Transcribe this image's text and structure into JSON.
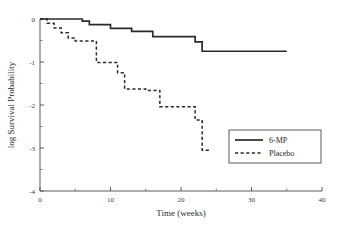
{
  "chart_data": {
    "type": "line",
    "title": "",
    "subtitle": "",
    "xlabel": "Time (weeks)",
    "ylabel": "log Survival Probability",
    "xlim": [
      0,
      40
    ],
    "ylim": [
      -4,
      0
    ],
    "xticks": [
      0,
      10,
      20,
      30,
      40
    ],
    "xticklabels": [
      "0",
      "10",
      "20",
      "30",
      "40"
    ],
    "xminorticks": [
      5,
      15,
      25,
      35
    ],
    "yticks": [
      0,
      -1,
      -2,
      -3,
      -4
    ],
    "yticklabels": [
      "0",
      "-1",
      "-2",
      "-3",
      "-4"
    ],
    "yminorticks": [
      -0.5,
      -1.5,
      -2.5,
      -3.5
    ],
    "grid": false,
    "legend_position": "center-right",
    "step_type": "post",
    "series": [
      {
        "name": "6-MP",
        "style": "solid",
        "color": "#2b2b2b",
        "x": [
          0,
          6,
          7,
          10,
          13,
          16,
          22,
          23,
          35
        ],
        "y": [
          0,
          0,
          -0.05,
          -0.13,
          -0.22,
          -0.29,
          -0.41,
          -0.75,
          -0.75
        ]
      },
      {
        "name": "Placebo",
        "style": "dashed",
        "color": "#2b2b2b",
        "x": [
          0,
          1,
          2,
          3,
          4,
          5,
          8,
          8,
          11,
          12,
          15,
          17,
          22,
          23
        ],
        "y": [
          0,
          -0.09,
          -0.19,
          -0.29,
          -0.4,
          -0.51,
          -0.51,
          -1.01,
          -1.25,
          -1.63,
          -1.63,
          -2.04,
          -2.35,
          -3.05
        ]
      }
    ],
    "series_points": {
      "6-MP": [
        {
          "x": 0,
          "y": 0
        },
        {
          "x": 6,
          "y": 0
        },
        {
          "x": 6,
          "y": -0.05
        },
        {
          "x": 7,
          "y": -0.05
        },
        {
          "x": 7,
          "y": -0.13
        },
        {
          "x": 10,
          "y": -0.13
        },
        {
          "x": 10,
          "y": -0.22
        },
        {
          "x": 13,
          "y": -0.22
        },
        {
          "x": 13,
          "y": -0.29
        },
        {
          "x": 16,
          "y": -0.29
        },
        {
          "x": 16,
          "y": -0.41
        },
        {
          "x": 22,
          "y": -0.41
        },
        {
          "x": 22,
          "y": -0.53
        },
        {
          "x": 23,
          "y": -0.53
        },
        {
          "x": 23,
          "y": -0.75
        },
        {
          "x": 35,
          "y": -0.75
        }
      ],
      "Placebo": [
        {
          "x": 0,
          "y": 0
        },
        {
          "x": 1,
          "y": 0
        },
        {
          "x": 1,
          "y": -0.1
        },
        {
          "x": 2,
          "y": -0.1
        },
        {
          "x": 2,
          "y": -0.21
        },
        {
          "x": 3,
          "y": -0.21
        },
        {
          "x": 3,
          "y": -0.32
        },
        {
          "x": 4,
          "y": -0.32
        },
        {
          "x": 4,
          "y": -0.44
        },
        {
          "x": 5,
          "y": -0.44
        },
        {
          "x": 5,
          "y": -0.51
        },
        {
          "x": 8,
          "y": -0.51
        },
        {
          "x": 8,
          "y": -1.01
        },
        {
          "x": 11,
          "y": -1.01
        },
        {
          "x": 11,
          "y": -1.25
        },
        {
          "x": 12,
          "y": -1.25
        },
        {
          "x": 12,
          "y": -1.63
        },
        {
          "x": 15,
          "y": -1.63
        },
        {
          "x": 15,
          "y": -1.66
        },
        {
          "x": 17,
          "y": -1.66
        },
        {
          "x": 17,
          "y": -2.04
        },
        {
          "x": 22,
          "y": -2.04
        },
        {
          "x": 22,
          "y": -2.35
        },
        {
          "x": 23,
          "y": -2.35
        },
        {
          "x": 23,
          "y": -3.05
        },
        {
          "x": 24,
          "y": -3.05
        }
      ]
    },
    "legend": [
      {
        "label": "6-MP",
        "style": "solid"
      },
      {
        "label": "Placebo",
        "style": "dashed"
      }
    ]
  }
}
